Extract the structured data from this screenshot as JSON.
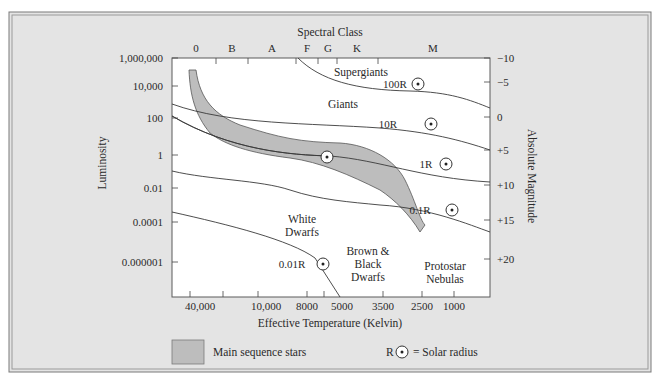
{
  "chart_data": {
    "type": "scatter",
    "top_axis": {
      "label": "Spectral Class",
      "ticks": [
        {
          "label": "0",
          "x": 196
        },
        {
          "label": "B",
          "x": 232
        },
        {
          "label": "A",
          "x": 272
        },
        {
          "label": "F",
          "x": 307
        },
        {
          "label": "G",
          "x": 328
        },
        {
          "label": "K",
          "x": 357
        },
        {
          "label": "M",
          "x": 433
        }
      ],
      "tick_marks": [
        216,
        248,
        296,
        318,
        337,
        378
      ]
    },
    "xlabel": "Effective Temperature (Kelvin)",
    "x_ticks": [
      {
        "label": "40,000",
        "x": 200
      },
      {
        "label": "10,000",
        "x": 266
      },
      {
        "label": "8000",
        "x": 307
      },
      {
        "label": "5000",
        "x": 342
      },
      {
        "label": "3500",
        "x": 383
      },
      {
        "label": "2500",
        "x": 422
      },
      {
        "label": "1000",
        "x": 454
      }
    ],
    "x_tick_marks": [
      190,
      223,
      258,
      307,
      324,
      383,
      422,
      454
    ],
    "ylabel": "Luminosity",
    "y_ticks": [
      {
        "label": "1,000,000",
        "y": 58
      },
      {
        "label": "10,000",
        "y": 86
      },
      {
        "label": "100",
        "y": 118
      },
      {
        "label": "1",
        "y": 155
      },
      {
        "label": "0.01",
        "y": 188
      },
      {
        "label": "0.0001",
        "y": 222
      },
      {
        "label": "0.000001",
        "y": 262
      }
    ],
    "y2label": "Absolute Magnitude",
    "y2_ticks": [
      {
        "label": "−10",
        "y": 58
      },
      {
        "label": "−5",
        "y": 82
      },
      {
        "label": "0",
        "y": 117
      },
      {
        "label": "+5",
        "y": 150
      },
      {
        "label": "+10",
        "y": 185
      },
      {
        "label": "+15",
        "y": 220
      },
      {
        "label": "+20",
        "y": 259
      }
    ],
    "regions": [
      {
        "label_lines": [
          "Supergiants"
        ],
        "x": 361,
        "y": 76
      },
      {
        "label_lines": [
          "Giants"
        ],
        "x": 343,
        "y": 108
      },
      {
        "label_lines": [
          "White",
          "Dwarfs"
        ],
        "x": 302,
        "y": 223
      },
      {
        "label_lines": [
          "Brown &",
          "Black",
          "Dwarfs"
        ],
        "x": 368,
        "y": 255
      },
      {
        "label_lines": [
          "Protostar",
          "Nebulas"
        ],
        "x": 445,
        "y": 270
      }
    ],
    "radius_lines": [
      {
        "label": "100R",
        "label_x": 395,
        "label_y": 88,
        "marker_x": 418,
        "marker_y": 84,
        "path": "M 298 58 C 320 80, 355 90, 410 91 C 450 92, 470 100, 490 108"
      },
      {
        "label": "10R",
        "label_x": 388,
        "label_y": 128,
        "marker_x": 431,
        "marker_y": 124,
        "path": "M 172 104 C 230 125, 310 123, 380 128 C 430 132, 460 140, 490 150"
      },
      {
        "label": "1R",
        "label_x": 426,
        "label_y": 168,
        "marker_x": 446,
        "marker_y": 164,
        "path": "M 172 116 C 230 150, 290 155, 330 156 C 380 160, 420 178, 490 182"
      },
      {
        "label": "0.1R",
        "label_x": 420,
        "label_y": 214,
        "marker_x": 452,
        "marker_y": 210,
        "path": "M 172 171 C 210 180, 260 180, 290 190 C 320 200, 350 202, 380 205 C 430 208, 470 225, 490 232"
      },
      {
        "label": "0.01R",
        "label_x": 292,
        "label_y": 268,
        "marker_x": 323,
        "marker_y": 264,
        "path": "M 172 212 C 230 225, 290 240, 315 258 L 340 297"
      }
    ],
    "main_sequence": {
      "path": "M 189 70 L 196 70 C 200 100, 215 115, 240 125 C 280 138, 300 142, 340 143 C 370 145, 395 160, 405 180 C 415 200, 420 220, 425 225 L 420 232 C 410 215, 395 200, 380 190 C 350 175, 320 162, 290 158 C 250 153, 225 145, 210 133 C 195 115, 190 95, 189 70 Z",
      "fill": "#bdbdbd",
      "stroke": "#555555"
    },
    "sun": {
      "x": 327,
      "y": 157
    }
  },
  "legend": {
    "main_sequence_label": "Main sequence stars",
    "solar_radius_symbol": "R",
    "solar_radius_label": "= Solar radius"
  },
  "colors": {
    "panel_background": "#e4e4e4",
    "plot_background": "#ffffff",
    "main_sequence_fill": "#bdbdbd",
    "line": "#3a3a3a",
    "border": "#8a8a8a"
  }
}
